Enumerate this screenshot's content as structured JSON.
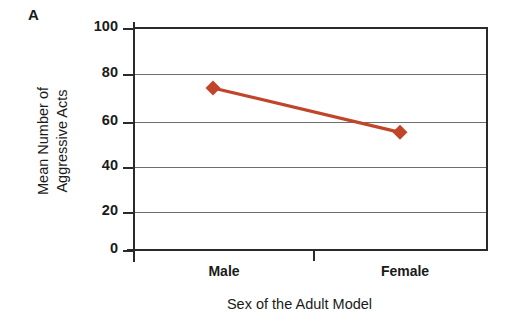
{
  "panel": {
    "letter": "A"
  },
  "axes": {
    "y_title_line1": "Mean Number of",
    "y_title_line2": "Aggressive Acts",
    "x_title": "Sex of the Adult Model",
    "y_ticks": [
      "100",
      "80",
      "60",
      "40",
      "20",
      "0"
    ],
    "x_ticks": [
      "Male",
      "Female"
    ]
  },
  "colors": {
    "series": "#C0452A",
    "axis": "#2a2a2a",
    "grid": "#6e6e6e",
    "background": "#ffffff",
    "text": "#1a1a1a"
  },
  "chart_data": {
    "type": "line",
    "title": "A",
    "categories": [
      "Male",
      "Female"
    ],
    "values": [
      73,
      53
    ],
    "series": [
      {
        "name": "Mean Number of Aggressive Acts",
        "values": [
          73,
          53
        ],
        "color": "#C0452A",
        "marker": "diamond"
      }
    ],
    "xlabel": "Sex of the Adult Model",
    "ylabel": "Mean Number of Aggressive Acts",
    "ylim": [
      0,
      100
    ],
    "ytick_values": [
      0,
      20,
      40,
      60,
      80,
      100
    ],
    "grid": "horizontal",
    "legend": "none"
  }
}
